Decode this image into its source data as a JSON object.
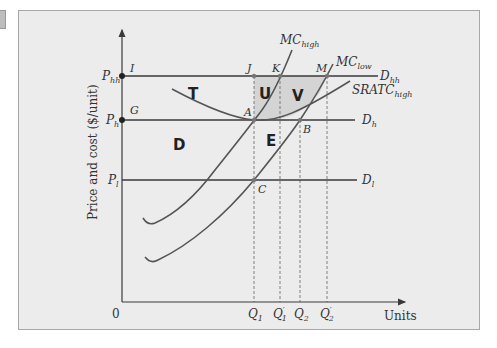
{
  "figure": {
    "y_axis_label": "Price and cost ($/unit)",
    "x_axis_label": "Units",
    "origin_label": "0",
    "price_levels": [
      {
        "id": "Phh",
        "label": "P",
        "sub": "hh",
        "demand_label": "D",
        "demand_sub": "hh"
      },
      {
        "id": "Ph",
        "label": "P",
        "sub": "h",
        "demand_label": "D",
        "demand_sub": "h"
      },
      {
        "id": "Pl",
        "label": "P",
        "sub": "l",
        "demand_label": "D",
        "demand_sub": "l"
      }
    ],
    "quantities": [
      {
        "label": "Q",
        "sub": "1",
        "prime": ""
      },
      {
        "label": "Q",
        "sub": "1",
        "prime": "′"
      },
      {
        "label": "Q",
        "sub": "2",
        "prime": ""
      },
      {
        "label": "Q",
        "sub": "2",
        "prime": "′"
      }
    ],
    "curves": {
      "mc_high": {
        "label": "MC",
        "sub": "high"
      },
      "mc_low": {
        "label": "MC",
        "sub": "low"
      },
      "sratc_high": {
        "label": "SRATC",
        "sub": "high"
      }
    },
    "points": {
      "I": "I",
      "J": "J",
      "K": "K",
      "M": "M",
      "G": "G",
      "A": "A",
      "B": "B",
      "C": "C"
    },
    "regions": {
      "T": "T",
      "U": "U",
      "V": "V",
      "D": "D",
      "E": "E"
    },
    "colors": {
      "panel_bg": "#ececec",
      "shaded_region": "#d6d6d6",
      "line": "#3a3a3a",
      "curve": "#555555"
    }
  }
}
